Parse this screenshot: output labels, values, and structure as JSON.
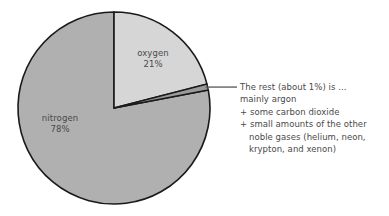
{
  "chart_data": {
    "type": "pie",
    "title": "",
    "subtitle": "",
    "xlabel": "",
    "ylabel": "",
    "legend_position": "none",
    "grid": false,
    "unit": "%",
    "start_angle_deg": 0,
    "direction": "clockwise",
    "categories": [
      "nitrogen",
      "oxygen",
      "the rest"
    ],
    "values": [
      78,
      21,
      1
    ],
    "slices": [
      {
        "name": "oxygen",
        "label": "oxygen",
        "value": 21,
        "value_label": "21%",
        "color": "#d6d6d6",
        "start_angle_deg": 0,
        "end_angle_deg": 75.6,
        "label_position": "inside"
      },
      {
        "name": "the-rest",
        "label": "The rest (about 1%)",
        "value": 1,
        "value_label": "1%",
        "color": "#9a9a9a",
        "start_angle_deg": 75.6,
        "end_angle_deg": 79.2,
        "label_position": "callout"
      },
      {
        "name": "nitrogen",
        "label": "nitrogen",
        "value": 78,
        "value_label": "78%",
        "color": "#b0b0b0",
        "start_angle_deg": 79.2,
        "end_angle_deg": 360,
        "label_position": "inside"
      }
    ],
    "annotation": {
      "target_slice": "the-rest",
      "lines": [
        "The rest (about 1%) is ...",
        "mainly argon",
        "+ some carbon dioxide",
        "+ small amounts of the other",
        "noble gases (helium, neon,",
        "krypton, and xenon)"
      ]
    },
    "colors": {
      "nitrogen": "#b0b0b0",
      "oxygen": "#d6d6d6",
      "the_rest": "#9a9a9a",
      "outline": "#1a1a1a",
      "text": "#4a4a4a",
      "background": "#ffffff"
    }
  },
  "labels": {
    "oxygen": {
      "name": "oxygen",
      "pct": "21%"
    },
    "nitrogen": {
      "name": "nitrogen",
      "pct": "78%"
    }
  },
  "annotation": {
    "line1": "The rest (about 1%) is ...",
    "line2": "mainly argon",
    "line3": "+ some carbon dioxide",
    "line4": "+ small amounts of the other",
    "line5": "noble gases (helium, neon,",
    "line6": "krypton, and xenon)"
  }
}
